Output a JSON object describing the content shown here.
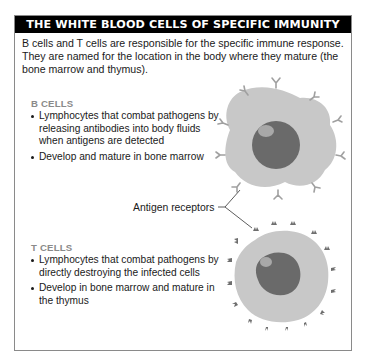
{
  "header": {
    "title": "THE WHITE BLOOD CELLS OF SPECIFIC IMMUNITY"
  },
  "intro": "B cells and T cells are responsible for the specific immune response. They are named for the location in the body where they mature (the bone marrow and thymus).",
  "b_cells": {
    "title": "B CELLS",
    "bullets": [
      "Lymphocytes that combat pathogens by releasing antibodies into body fluids when antigens are detected",
      "Develop and mature in bone marrow"
    ]
  },
  "t_cells": {
    "title": "T CELLS",
    "bullets": [
      "Lymphocytes that combat pathogens by directly destroying the infected cells",
      "Develop in bone marrow and mature in the thymus"
    ]
  },
  "callout": {
    "label": "Antigen receptors"
  },
  "colors": {
    "header_bg": "#000000",
    "cell_body": "#c8c8c8",
    "nucleus": "#6a6a6a",
    "receptor_b": "#a0a0a0",
    "receptor_t": "#6e6e6e",
    "section_title": "#8a8a8a"
  }
}
